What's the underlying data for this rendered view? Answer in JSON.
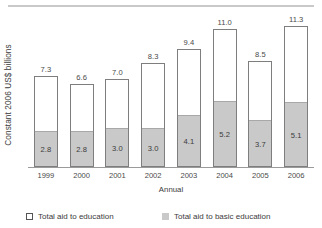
{
  "chart_data": {
    "type": "bar",
    "title": "",
    "subtitle": "",
    "xlabel": "Annual",
    "ylabel": "Constant 2006 US$ billions",
    "categories": [
      "1999",
      "2000",
      "2001",
      "2002",
      "2003",
      "2004",
      "2005",
      "2006"
    ],
    "series": [
      {
        "name": "Total aid to education",
        "values": [
          7.3,
          6.6,
          7.0,
          8.3,
          9.4,
          11.0,
          8.5,
          11.3
        ],
        "labels": [
          "7.3",
          "6.6",
          "7.0",
          "8.3",
          "9.4",
          "11.0",
          "8.5",
          "11.3"
        ],
        "color": "#ffffff",
        "border_color": "#7e7e7e"
      },
      {
        "name": "Total aid to basic education",
        "values": [
          2.8,
          2.8,
          3.0,
          3.0,
          4.1,
          5.2,
          3.7,
          5.1
        ],
        "labels": [
          "2.8",
          "2.8",
          "3.0",
          "3.0",
          "4.1",
          "5.2",
          "3.7",
          "5.1"
        ],
        "color": "#c9c9c9",
        "border_color": "#a8a8a8"
      }
    ],
    "ylim": [
      0,
      11.9
    ],
    "grid": false,
    "legend_position": "bottom",
    "stacked": true,
    "axis_color": "#9a9a9a"
  },
  "legend": {
    "items": [
      {
        "label": "Total aid to education",
        "swatch": "open-square"
      },
      {
        "label": "Total aid to basic education",
        "swatch": "filled-square"
      }
    ]
  }
}
